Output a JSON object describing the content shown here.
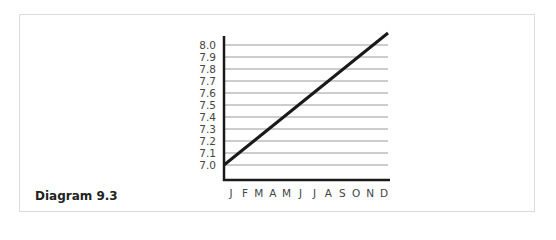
{
  "caption": "Diagram 9.3",
  "chart_data": {
    "type": "line",
    "title": "",
    "xlabel": "",
    "ylabel": "",
    "categories": [
      "J",
      "F",
      "M",
      "A",
      "M",
      "J",
      "J",
      "A",
      "S",
      "O",
      "N",
      "D"
    ],
    "series": [
      {
        "name": "value",
        "values": [
          7.0,
          7.1,
          7.2,
          7.3,
          7.4,
          7.5,
          7.6,
          7.7,
          7.8,
          7.9,
          8.0,
          8.1
        ]
      }
    ],
    "yticks": [
      "8.0",
      "7.9",
      "7.8",
      "7.7",
      "7.6",
      "7.5",
      "7.4",
      "7.3",
      "7.2",
      "7.1",
      "7.0"
    ],
    "ylim": [
      6.9,
      8.15
    ],
    "grid": true,
    "legend": "none",
    "colors": {
      "line": "#1a1a1a",
      "grid": "#9a9a9a",
      "axis": "#1a1a1a"
    }
  }
}
